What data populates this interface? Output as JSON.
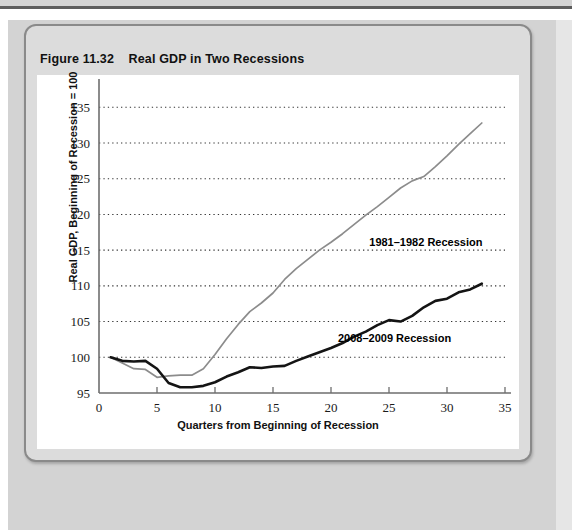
{
  "figure": {
    "number": "Figure 11.32",
    "title": "Real GDP in Two Recessions"
  },
  "chart_data": {
    "type": "line",
    "title": "Real GDP in Two Recessions",
    "xlabel": "Quarters from Beginning of Recession",
    "ylabel": "Real GDP, Beginning of Recession = 100",
    "xlim": [
      0,
      35
    ],
    "ylim": [
      95,
      137
    ],
    "xticks": [
      0,
      5,
      10,
      15,
      20,
      25,
      30,
      35
    ],
    "yticks": [
      95,
      100,
      105,
      110,
      115,
      120,
      125,
      130,
      135
    ],
    "grid": "horizontal-dotted",
    "legend": "inline-annotations",
    "series": [
      {
        "name": "1981–1982 Recession",
        "color": "#8c8c8c",
        "label_x": 23.3,
        "label_y": 116.2,
        "x": [
          1,
          2,
          3,
          4,
          5,
          6,
          7,
          8,
          9,
          10,
          11,
          12,
          13,
          14,
          15,
          16,
          17,
          18,
          19,
          20,
          21,
          22,
          23,
          24,
          25,
          26,
          27,
          28,
          29,
          30,
          31,
          32,
          33
        ],
        "y": [
          100.0,
          99.2,
          98.4,
          98.3,
          97.2,
          97.4,
          97.5,
          97.5,
          98.4,
          100.4,
          102.6,
          104.6,
          106.4,
          107.6,
          109.0,
          110.9,
          112.4,
          113.7,
          115.0,
          116.1,
          117.3,
          118.6,
          119.9,
          121.1,
          122.4,
          123.7,
          124.7,
          125.3,
          126.7,
          128.2,
          129.8,
          131.3,
          132.8
        ]
      },
      {
        "name": "2008–2009 Recession",
        "color": "#141414",
        "label_x": 20.6,
        "label_y": 102.7,
        "x": [
          1,
          2,
          3,
          4,
          5,
          6,
          7,
          8,
          9,
          10,
          11,
          12,
          13,
          14,
          15,
          16,
          17,
          18,
          19,
          20,
          21,
          22,
          23,
          24,
          25,
          26,
          27,
          28,
          29,
          30,
          31,
          32,
          33
        ],
        "y": [
          100.0,
          99.5,
          99.4,
          99.5,
          98.4,
          96.4,
          95.8,
          95.8,
          96.0,
          96.5,
          97.3,
          97.9,
          98.6,
          98.5,
          98.7,
          98.8,
          99.5,
          100.1,
          100.7,
          101.3,
          102.0,
          102.9,
          103.6,
          104.5,
          105.2,
          105.0,
          105.8,
          107.0,
          107.9,
          108.2,
          109.1,
          109.5,
          110.3
        ]
      }
    ]
  }
}
